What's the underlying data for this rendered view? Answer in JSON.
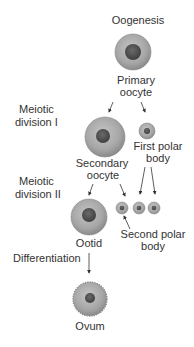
{
  "title": "Oogenesis",
  "stages": [
    {
      "label": "Meiotic division I"
    },
    {
      "label": "Meiotic division II"
    },
    {
      "label": "Differentiation"
    }
  ],
  "stage_lines": {
    "m1a": "Meiotic",
    "m1b": "division I",
    "m2a": "Meiotic",
    "m2b": "division II",
    "diff": "Differentiation"
  },
  "cells": {
    "primary_oocyte": {
      "line1": "Primary",
      "line2": "oocyte"
    },
    "secondary_oocyte": {
      "line1": "Secondary",
      "line2": "oocyte"
    },
    "first_polar_body": {
      "line1": "First polar",
      "line2": "body"
    },
    "second_polar_body": {
      "line1": "Second polar",
      "line2": "body"
    },
    "ootid": {
      "line1": "Ootid"
    },
    "ovum": {
      "line1": "Ovum"
    }
  },
  "colors": {
    "cytoplasm": "#a9a9a9",
    "cytoplasm_edge": "#8a8a8a",
    "nucleus": "#555555",
    "text": "#333333",
    "arrow": "#333333"
  }
}
